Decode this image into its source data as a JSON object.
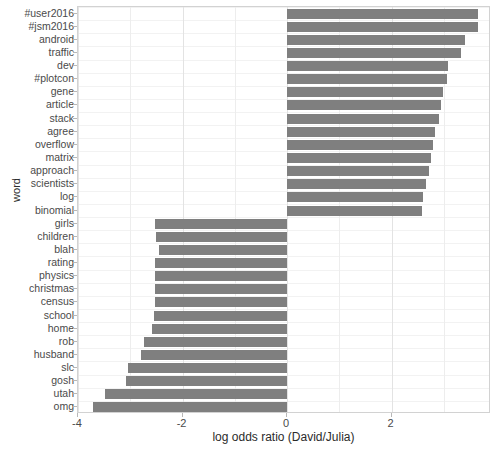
{
  "chart_data": {
    "type": "bar",
    "orientation": "horizontal",
    "title": "",
    "xlabel": "log odds ratio (David/Julia)",
    "ylabel": "word",
    "xlim": [
      -4.0,
      3.9
    ],
    "xticks": [
      -4,
      -2,
      0,
      2
    ],
    "xticklabels": [
      "-4",
      "-2",
      "0",
      "2"
    ],
    "grid": true,
    "legend": null,
    "bar_color": "#7f7f7f",
    "categories": [
      "#user2016",
      "#jsm2016",
      "android",
      "traffic",
      "dev",
      "#plotcon",
      "gene",
      "article",
      "stack",
      "agree",
      "overflow",
      "matrix",
      "approach",
      "scientists",
      "log",
      "binomial",
      "girls",
      "children",
      "blah",
      "rating",
      "physics",
      "christmas",
      "census",
      "school",
      "home",
      "rob",
      "husband",
      "slc",
      "gosh",
      "utah",
      "omg"
    ],
    "values": [
      3.65,
      3.65,
      3.4,
      3.32,
      3.07,
      3.05,
      2.99,
      2.94,
      2.9,
      2.82,
      2.79,
      2.75,
      2.72,
      2.65,
      2.6,
      2.58,
      -2.52,
      -2.51,
      -2.45,
      -2.53,
      -2.53,
      -2.52,
      -2.53,
      -2.55,
      -2.58,
      -2.73,
      -2.8,
      -3.04,
      -3.08,
      -3.48,
      -3.71
    ]
  },
  "axes": {
    "y_title": "word",
    "x_title": "log odds ratio (David/Julia)"
  }
}
